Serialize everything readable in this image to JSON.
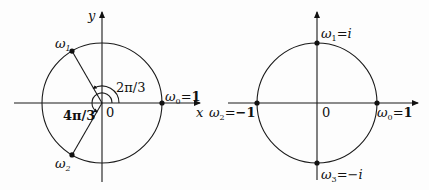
{
  "figures": [
    {
      "id": "cube-roots-of-unity",
      "axes": {
        "x_label": "x",
        "y_label": "y",
        "origin_label": "0"
      },
      "points": [
        {
          "name": "ω",
          "sub": "0",
          "value": "1",
          "angle_deg": 0
        },
        {
          "name": "ω",
          "sub": "1",
          "value": "",
          "angle_deg": 120
        },
        {
          "name": "ω",
          "sub": "2",
          "value": "",
          "angle_deg": 240
        }
      ],
      "angle_labels": [
        {
          "text": "2π/3",
          "angle_deg": 120
        },
        {
          "text": "4π/3",
          "angle_deg": 240
        }
      ]
    },
    {
      "id": "fourth-roots-of-unity",
      "axes": {
        "origin_label": "0"
      },
      "points": [
        {
          "name": "ω",
          "sub": "0",
          "value": "1",
          "angle_deg": 0
        },
        {
          "name": "ω",
          "sub": "1",
          "value": "i",
          "angle_deg": 90
        },
        {
          "name": "ω",
          "sub": "2",
          "value": "−1",
          "angle_deg": 180
        },
        {
          "name": "ω",
          "sub": "3",
          "value": "−i",
          "angle_deg": 270
        }
      ]
    }
  ],
  "equals": "="
}
